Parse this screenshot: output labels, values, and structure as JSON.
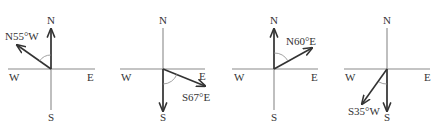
{
  "colors": {
    "background": "#ffffff",
    "axis": "#8a8a8a",
    "vector": "#333333",
    "text": "#333333"
  },
  "compasses": [
    {
      "cx": 51,
      "cy": 69,
      "labels": {
        "n": "N",
        "s": "S",
        "w": "W",
        "e": "E"
      },
      "bearing": "N55°W",
      "reference": "N",
      "angle_deg": 55,
      "vector_heading_deg": 305
    },
    {
      "cx": 163,
      "cy": 69,
      "labels": {
        "n": "N",
        "s": "S",
        "w": "W",
        "e": "E"
      },
      "bearing": "S67°E",
      "reference": "S",
      "angle_deg": 67,
      "vector_heading_deg": 113
    },
    {
      "cx": 274,
      "cy": 69,
      "labels": {
        "n": "N",
        "s": "S",
        "w": "W",
        "e": "E"
      },
      "bearing": "N60°E",
      "reference": "N",
      "angle_deg": 60,
      "vector_heading_deg": 60
    },
    {
      "cx": 387,
      "cy": 69,
      "labels": {
        "n": "N",
        "s": "S",
        "w": "W",
        "e": "E"
      },
      "bearing": "S35°W",
      "reference": "S",
      "angle_deg": 35,
      "vector_heading_deg": 215
    }
  ]
}
